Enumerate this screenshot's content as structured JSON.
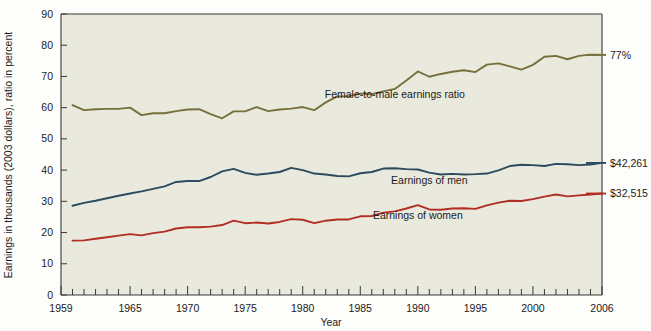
{
  "chart_data": {
    "type": "line",
    "title": "",
    "xlabel": "Year",
    "ylabel": "Earnings in thousands (2003 dollars), ratio in percent",
    "xlim": [
      1959,
      2006
    ],
    "ylim": [
      0,
      90
    ],
    "grid": false,
    "legend_position": "inline-annotations",
    "x_ticks": [
      1959,
      1965,
      1970,
      1975,
      1980,
      1985,
      1990,
      1995,
      2000,
      2006
    ],
    "x_tick_labels": [
      "1959",
      "1965",
      "1970",
      "1975",
      "1980",
      "1985",
      "1990",
      "1995",
      "2000",
      "2006"
    ],
    "x_minor_tick_step": 1,
    "y_ticks": [
      0,
      10,
      20,
      30,
      40,
      50,
      60,
      70,
      80,
      90
    ],
    "y_tick_labels": [
      "0",
      "10",
      "20",
      "30",
      "40",
      "50",
      "60",
      "70",
      "80",
      "90"
    ],
    "x": [
      1960,
      1961,
      1962,
      1963,
      1964,
      1965,
      1966,
      1967,
      1968,
      1969,
      1970,
      1971,
      1972,
      1973,
      1974,
      1975,
      1976,
      1977,
      1978,
      1979,
      1980,
      1981,
      1982,
      1983,
      1984,
      1985,
      1986,
      1987,
      1988,
      1989,
      1990,
      1991,
      1992,
      1993,
      1994,
      1995,
      1996,
      1997,
      1998,
      1999,
      2000,
      2001,
      2002,
      2003,
      2004,
      2005,
      2006
    ],
    "series": [
      {
        "name": "Female-to-male earnings ratio",
        "color": "#76703c",
        "unit": "percent",
        "end_value_label": "77%",
        "values": [
          60.8,
          59.2,
          59.5,
          59.6,
          59.6,
          60.0,
          57.6,
          58.2,
          58.2,
          58.9,
          59.4,
          59.5,
          57.9,
          56.6,
          58.8,
          58.8,
          60.2,
          58.9,
          59.4,
          59.7,
          60.2,
          59.2,
          61.7,
          63.6,
          63.7,
          64.5,
          64.3,
          65.2,
          66.0,
          68.7,
          71.6,
          69.9,
          70.8,
          71.5,
          72.0,
          71.4,
          73.8,
          74.2,
          73.2,
          72.2,
          73.7,
          76.3,
          76.6,
          75.5,
          76.6,
          77.0,
          76.9
        ]
      },
      {
        "name": "Earnings of men",
        "color": "#2d4a5e",
        "unit": "thousands of 2003 dollars",
        "end_value_label": "$42,261",
        "values": [
          28.6,
          29.5,
          30.2,
          31.0,
          31.8,
          32.5,
          33.2,
          34.0,
          34.8,
          36.2,
          36.5,
          36.5,
          37.8,
          39.6,
          40.4,
          39.1,
          38.5,
          38.9,
          39.4,
          40.7,
          40.0,
          38.9,
          38.6,
          38.1,
          38.0,
          39.0,
          39.4,
          40.5,
          40.6,
          40.3,
          40.2,
          39.2,
          38.6,
          38.8,
          38.6,
          38.7,
          38.9,
          39.9,
          41.3,
          41.7,
          41.6,
          41.3,
          42.0,
          41.9,
          41.6,
          41.8,
          42.3
        ]
      },
      {
        "name": "Earnings of women",
        "color": "#b22e22",
        "unit": "thousands of 2003 dollars",
        "end_value_label": "$32,515",
        "values": [
          17.4,
          17.5,
          18.0,
          18.5,
          19.0,
          19.5,
          19.1,
          19.8,
          20.3,
          21.3,
          21.7,
          21.7,
          21.9,
          22.4,
          23.8,
          23.0,
          23.2,
          22.9,
          23.4,
          24.3,
          24.1,
          23.0,
          23.8,
          24.2,
          24.2,
          25.2,
          25.3,
          26.4,
          26.8,
          27.7,
          28.8,
          27.4,
          27.3,
          27.7,
          27.8,
          27.6,
          28.7,
          29.6,
          30.2,
          30.1,
          30.7,
          31.5,
          32.2,
          31.6,
          31.9,
          32.2,
          32.5
        ]
      }
    ],
    "annotations": [
      {
        "text": "Female-to-male earnings ratio",
        "x": 1988,
        "y": 63,
        "name": "ratio-series-label"
      },
      {
        "text": "Earnings of men",
        "x": 1991,
        "y": 35.5,
        "name": "men-series-label"
      },
      {
        "text": "Earnings of women",
        "x": 1990,
        "y": 24.5,
        "name": "women-series-label"
      }
    ],
    "end_labels": [
      {
        "text": "77%",
        "name": "ratio-end-label"
      },
      {
        "text": "$42,261",
        "name": "men-end-label"
      },
      {
        "text": "$32,515",
        "name": "women-end-label"
      }
    ]
  },
  "colors": {
    "plot_background": "#e9e9de",
    "page_background": "#fdfdfb",
    "axis": "#3a3a3a",
    "ratio_line": "#76703c",
    "men_line": "#2d4a5e",
    "women_line": "#b22e22"
  }
}
